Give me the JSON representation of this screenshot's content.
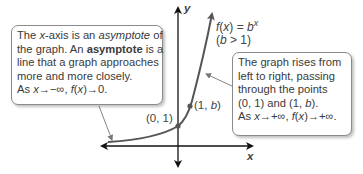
{
  "left_callout": {
    "line1_a": "The ",
    "line1_b": "x",
    "line1_c": "-axis is an ",
    "line1_d": "asymptote",
    "line1_e": " of",
    "line2_a": "the graph. An ",
    "line2_b": "asymptote",
    "line2_c": " is a",
    "line3": "line that a graph approaches",
    "line4": "more and more closely.",
    "line5_a": "As ",
    "line5_b": "x",
    "line5_c": "→−∞, ",
    "line5_d": "f",
    "line5_e": "(",
    "line5_f": "x",
    "line5_g": ")→0."
  },
  "right_callout": {
    "line1": "The graph rises from",
    "line2": "left to right, passing",
    "line3": "through the points",
    "line4_a": "(0, 1) and (1, ",
    "line4_b": "b",
    "line4_c": ").",
    "line5_a": "As ",
    "line5_b": "x",
    "line5_c": "→+∞, ",
    "line5_d": "f",
    "line5_e": "(",
    "line5_f": "x",
    "line5_g": ")→+∞."
  },
  "function_label": {
    "f": "f",
    "x": "x",
    "eq": ") = ",
    "b": "b",
    "exp": "x",
    "open": "(",
    "cond_open": "(",
    "cond_b": "b",
    "cond_rest": " > 1)"
  },
  "axes": {
    "x_label": "x",
    "y_label": "y"
  },
  "points": [
    {
      "label": "(0, 1)"
    },
    {
      "label_a": "(1, ",
      "label_b": "b",
      "label_c": ")"
    }
  ],
  "colors": {
    "curve": "#555555",
    "axis": "#111111",
    "box_border": "#8a8a8a"
  }
}
